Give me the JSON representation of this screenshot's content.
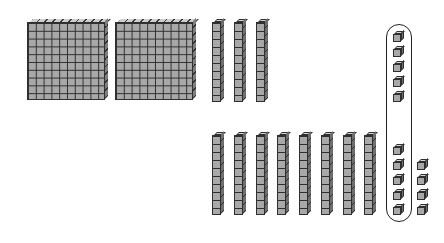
{
  "diagram": {
    "type": "base-ten-blocks",
    "colors": {
      "block_fill": "#a8a8a8",
      "block_edge": "#2f2f2f",
      "background": "#ffffff",
      "capsule_stroke": "#222222"
    },
    "hundreds_flats": [
      {
        "x": 27,
        "y": 22
      },
      {
        "x": 115,
        "y": 22
      }
    ],
    "tens_rods_top": [
      {
        "x": 212,
        "y": 22
      },
      {
        "x": 234,
        "y": 22
      },
      {
        "x": 256,
        "y": 22
      }
    ],
    "tens_rods_bottom": [
      {
        "x": 212,
        "y": 135
      },
      {
        "x": 234,
        "y": 135
      },
      {
        "x": 256,
        "y": 135
      },
      {
        "x": 277,
        "y": 135
      },
      {
        "x": 299,
        "y": 135
      },
      {
        "x": 321,
        "y": 135
      },
      {
        "x": 343,
        "y": 135
      },
      {
        "x": 364,
        "y": 135
      }
    ],
    "units_grouped": [
      {
        "x": 393,
        "y": 34
      },
      {
        "x": 393,
        "y": 49
      },
      {
        "x": 393,
        "y": 64
      },
      {
        "x": 393,
        "y": 79
      },
      {
        "x": 393,
        "y": 94
      },
      {
        "x": 393,
        "y": 147
      },
      {
        "x": 393,
        "y": 162
      },
      {
        "x": 393,
        "y": 177
      },
      {
        "x": 393,
        "y": 192
      },
      {
        "x": 393,
        "y": 207
      }
    ],
    "units_loose": [
      {
        "x": 417,
        "y": 162
      },
      {
        "x": 417,
        "y": 177
      },
      {
        "x": 417,
        "y": 192
      },
      {
        "x": 417,
        "y": 207
      }
    ],
    "counts": {
      "hundreds": 2,
      "tens": 11,
      "units": 14,
      "units_circled": 10
    }
  }
}
